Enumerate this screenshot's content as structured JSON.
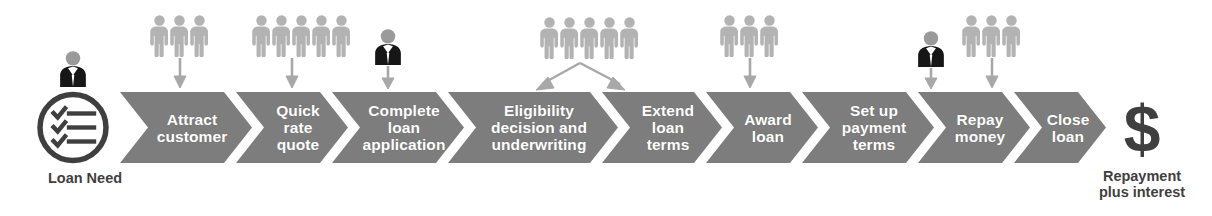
{
  "diagram": {
    "type": "process-flow-chevrons",
    "colors": {
      "chevron_fill": "#7d7d7d",
      "chevron_text": "#ffffff",
      "person_light": "#b3b3b3",
      "person_dark": "#1a1a1a",
      "arrow": "#a8a8a8",
      "caption_text": "#3f3f3f",
      "outline_icon": "#3f3f3f",
      "background": "#ffffff"
    },
    "start": {
      "icon_name": "checklist-circle-icon",
      "checkmark_rows": 3,
      "caption": "Loan Need"
    },
    "end": {
      "icon_name": "dollar-sign-icon",
      "symbol": "$",
      "caption": "Repayment\nplus interest"
    },
    "steps": [
      {
        "index": 1,
        "label": "Attract\ncustomer",
        "x": 120,
        "width": 132
      },
      {
        "index": 2,
        "label": "Quick\nrate\nquote",
        "x": 236,
        "width": 112
      },
      {
        "index": 3,
        "label": "Complete\nloan\napplication",
        "x": 332,
        "width": 132
      },
      {
        "index": 4,
        "label": "Eligibility\ndecision and\nunderwriting",
        "x": 448,
        "width": 170
      },
      {
        "index": 5,
        "label": "Extend\nloan\nterms",
        "x": 602,
        "width": 120
      },
      {
        "index": 6,
        "label": "Award\nloan",
        "x": 706,
        "width": 112
      },
      {
        "index": 7,
        "label": "Set up\npayment\nterms",
        "x": 802,
        "width": 132
      },
      {
        "index": 8,
        "label": "Repay\nmoney",
        "x": 918,
        "width": 112
      },
      {
        "index": 9,
        "label": "Close\nloan",
        "x": 1014,
        "width": 114
      }
    ],
    "actor_groups": [
      {
        "id": "a1",
        "icon_name": "businessperson-icon",
        "style": "dark",
        "count": 1,
        "center_x": 73,
        "targets_step": 0,
        "arrow": "none"
      },
      {
        "id": "a2",
        "icon_name": "people-group-icon",
        "style": "light",
        "count": 3,
        "center_x": 180,
        "targets_step": 1,
        "arrow": "down"
      },
      {
        "id": "a3",
        "icon_name": "people-group-icon",
        "style": "light",
        "count": 5,
        "center_x": 292,
        "targets_step": 2,
        "arrow": "down"
      },
      {
        "id": "a4",
        "icon_name": "businessperson-icon",
        "style": "dark",
        "count": 1,
        "center_x": 388,
        "targets_step": 3,
        "arrow": "down"
      },
      {
        "id": "a5",
        "icon_name": "people-group-icon",
        "style": "light",
        "count": 5,
        "center_x": 580,
        "targets_step": 4,
        "arrow": "split"
      },
      {
        "id": "a6",
        "icon_name": "people-group-icon",
        "style": "light",
        "count": 3,
        "center_x": 750,
        "targets_step": 6,
        "arrow": "down"
      },
      {
        "id": "a7",
        "icon_name": "businessperson-icon",
        "style": "dark",
        "count": 1,
        "center_x": 931,
        "targets_step": 8,
        "arrow": "down"
      },
      {
        "id": "a8",
        "icon_name": "people-group-icon",
        "style": "light",
        "count": 3,
        "center_x": 992,
        "targets_step": 9,
        "arrow": "down"
      }
    ]
  }
}
